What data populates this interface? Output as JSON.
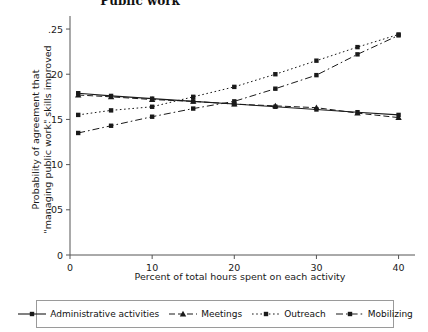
{
  "chart_data": {
    "type": "line",
    "title": "Public work",
    "title_truncated": true,
    "xlabel": "Percent of total hours spent on each activity",
    "ylabel": "Probability of agreement that \"managing public work\" skills improved",
    "ylabel_line1": "Probability of agreement that",
    "ylabel_line2": "\"managing public work\" skills improved",
    "x": [
      1,
      5,
      10,
      15,
      20,
      25,
      30,
      35,
      40
    ],
    "xticks": [
      0,
      10,
      20,
      30,
      40
    ],
    "xticklabels": [
      "0",
      "10",
      "20",
      "30",
      "40"
    ],
    "yticks": [
      0,
      0.05,
      0.1,
      0.15,
      0.2,
      0.25
    ],
    "yticklabels": [
      "0",
      ".05",
      ".10",
      ".15",
      ".20",
      ".25"
    ],
    "xlim": [
      0,
      42
    ],
    "ylim": [
      0,
      0.26
    ],
    "grid": false,
    "legend_position": "bottom",
    "series": [
      {
        "name": "Administrative activities",
        "style": "solid",
        "marker": "square",
        "values": [
          0.179,
          0.176,
          0.173,
          0.17,
          0.167,
          0.164,
          0.161,
          0.158,
          0.155
        ]
      },
      {
        "name": "Meetings",
        "style": "dashed",
        "marker": "triangle",
        "values": [
          0.177,
          0.175,
          0.172,
          0.17,
          0.167,
          0.165,
          0.163,
          0.157,
          0.152
        ]
      },
      {
        "name": "Outreach",
        "style": "dotted",
        "marker": "square",
        "values": [
          0.155,
          0.16,
          0.164,
          0.175,
          0.186,
          0.2,
          0.215,
          0.23,
          0.244
        ]
      },
      {
        "name": "Mobilizing",
        "style": "dashdot",
        "marker": "square",
        "values": [
          0.135,
          0.143,
          0.153,
          0.162,
          0.17,
          0.184,
          0.199,
          0.222,
          0.243
        ]
      }
    ]
  },
  "colors": {
    "line": "#1a1a1a",
    "axis": "#555555",
    "legend_border": "#9a9a9a",
    "background": "#ffffff"
  }
}
